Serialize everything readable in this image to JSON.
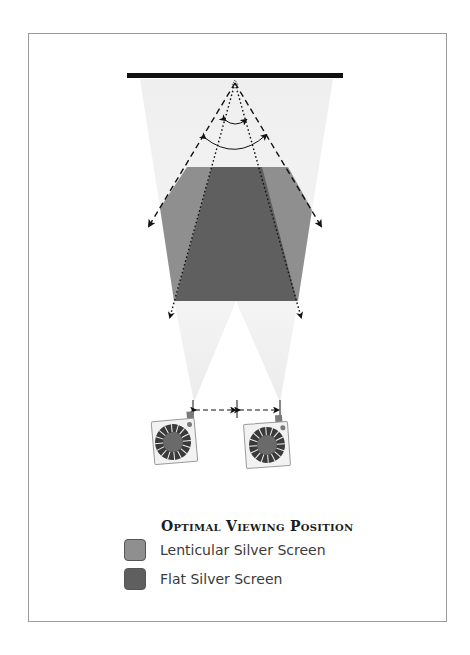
{
  "diagram": {
    "title": "Optimal Viewing Position",
    "colors": {
      "screen_bar": "#111111",
      "light_cone": "#f0f0f0",
      "lenticular": "#8f8f8f",
      "flat": "#5f5f5f",
      "projector_body": "#f2f2f2",
      "reel_outer": "#3a3a3a",
      "reel_inner": "#6a6a6a",
      "frame_border": "#9a9a9a"
    },
    "elements": {
      "screen": "projection-screen",
      "projectors": [
        "projector-left",
        "projector-right"
      ],
      "angle_arcs": [
        "flat-screen-viewing-angle",
        "lenticular-screen-viewing-angle"
      ],
      "spacing_indicator": "projector-spacing-dimension"
    }
  },
  "legend": {
    "title": "Optimal Viewing Position",
    "items": [
      {
        "label": "Lenticular Silver Screen",
        "color": "#8f8f8f"
      },
      {
        "label": "Flat Silver Screen",
        "color": "#5f5f5f"
      }
    ]
  }
}
